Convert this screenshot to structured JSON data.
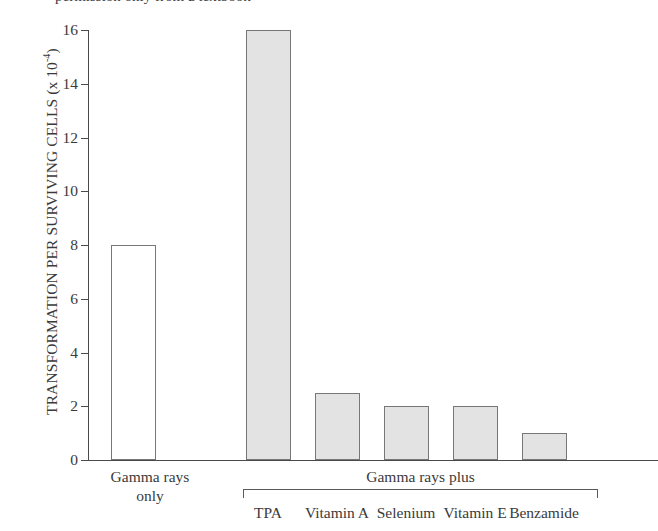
{
  "caption_sliver": "permission only from a textbook",
  "axis": {
    "y_title_main": "TRANSFORMATION PER SURVIVING CELLS (x 10",
    "y_title_sup": "-4",
    "y_title_close": ")",
    "y_ticks": [
      "16",
      "14",
      "12",
      "10",
      "8",
      "6",
      "4",
      "2",
      "0"
    ]
  },
  "groups": {
    "left_line1": "Gamma rays",
    "left_line2": "only",
    "right_label": "Gamma rays plus"
  },
  "colors": {
    "bar_open_fill": "#ffffff",
    "bar_filled_fill": "#e3e3e3",
    "bar_border": "#777777",
    "axis": "#4a4a4a",
    "text": "#3a3a3a",
    "background": "#ffffff"
  },
  "chart_data": {
    "type": "bar",
    "title": "",
    "xlabel": "",
    "ylabel": "TRANSFORMATION PER SURVIVING CELLS (x 10^-4)",
    "ylim": [
      0,
      16
    ],
    "ytick_values": [
      0,
      2,
      4,
      6,
      8,
      10,
      12,
      14,
      16
    ],
    "grid": false,
    "legend": false,
    "categories": [
      "Gamma rays only",
      "TPA",
      "Vitamin A",
      "Selenium",
      "Vitamin E",
      "Benzamide"
    ],
    "values": [
      8.0,
      16.0,
      2.5,
      2.0,
      2.0,
      1.0
    ],
    "bars": [
      {
        "label": "Gamma rays only",
        "value": 8.0,
        "style": "open",
        "group": "Gamma rays only"
      },
      {
        "label": "TPA",
        "value": 16.0,
        "style": "filled",
        "group": "Gamma rays plus"
      },
      {
        "label": "Vitamin A",
        "value": 2.5,
        "style": "filled",
        "group": "Gamma rays plus"
      },
      {
        "label": "Selenium",
        "value": 2.0,
        "style": "filled",
        "group": "Gamma rays plus"
      },
      {
        "label": "Vitamin E",
        "value": 2.0,
        "style": "filled",
        "group": "Gamma rays plus"
      },
      {
        "label": "Benzamide",
        "value": 1.0,
        "style": "filled",
        "group": "Gamma rays plus"
      }
    ]
  }
}
